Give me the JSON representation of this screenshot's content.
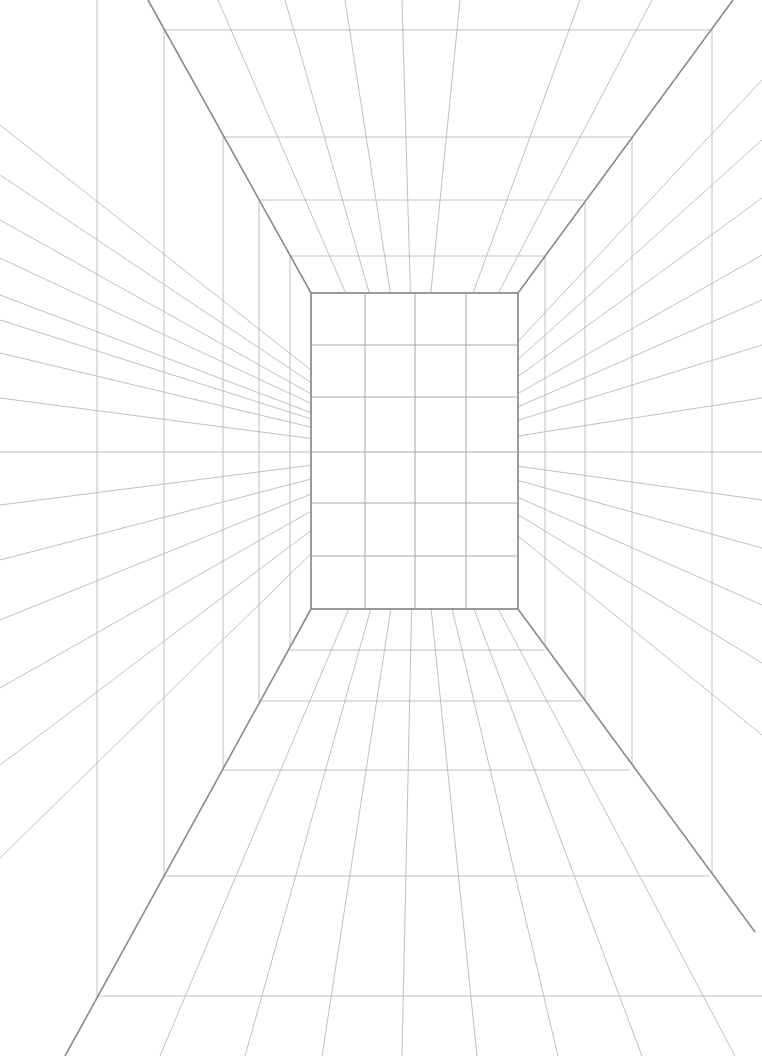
{
  "canvas": {
    "width": 762,
    "height": 1056,
    "background": "#ffffff"
  },
  "colors": {
    "line": "#b9b9b9",
    "edge": "#8a8a8a"
  },
  "vanishing_point": {
    "x": 415,
    "y": 452
  },
  "back_wall": {
    "x1": 311,
    "y1": 293,
    "x2": 518,
    "y2": 609,
    "columns_x": [
      365,
      415,
      466
    ],
    "rows_y": [
      345,
      397,
      452,
      503,
      556
    ]
  },
  "room_edges": [
    {
      "name": "ceiling-left-edge",
      "x1": 148,
      "y1": 0,
      "x2": 311,
      "y2": 293
    },
    {
      "name": "ceiling-right-edge",
      "x1": 733,
      "y1": 0,
      "x2": 518,
      "y2": 293
    },
    {
      "name": "floor-left-edge",
      "x1": 311,
      "y1": 609,
      "x2": 65,
      "y2": 1056
    },
    {
      "name": "floor-right-edge",
      "x1": 518,
      "y1": 609,
      "x2": 755,
      "y2": 932
    }
  ],
  "ceiling": {
    "horizontals": [
      {
        "y": 30,
        "x1": 165,
        "x2": 712
      },
      {
        "y": 137,
        "x1": 224,
        "x2": 632
      },
      {
        "y": 200,
        "x1": 259,
        "x2": 585
      },
      {
        "y": 256,
        "x1": 290,
        "x2": 545
      }
    ],
    "rays_top_x": [
      218,
      285,
      345,
      402,
      460,
      580,
      652
    ],
    "rays_bottom_x": [
      325,
      345,
      365,
      395,
      415,
      440,
      466,
      490
    ]
  },
  "floor": {
    "horizontals": [
      {
        "y": 650,
        "x1": 290,
        "x2": 545
      },
      {
        "y": 701,
        "x1": 261,
        "x2": 583
      },
      {
        "y": 770,
        "x1": 223,
        "x2": 630
      },
      {
        "y": 876,
        "x1": 164,
        "x2": 710
      },
      {
        "y": 996,
        "x1": 97,
        "x2": 762
      }
    ],
    "rays_bottom_x": [
      160,
      245,
      322,
      402,
      477,
      558,
      642,
      735
    ],
    "rays_top_x": [
      335,
      357,
      379,
      402,
      422,
      445,
      470,
      494
    ]
  },
  "left_wall": {
    "verticals_x": [
      97,
      164,
      223,
      259,
      290
    ],
    "rays_edge_y": [
      125,
      175,
      220,
      258,
      295,
      320,
      353,
      398,
      452,
      505,
      560,
      620,
      688,
      765,
      858
    ]
  },
  "right_wall": {
    "verticals_x": [
      545,
      585,
      632,
      712
    ],
    "rays_edge_y": [
      80,
      140,
      198,
      255,
      300,
      345,
      398,
      452,
      500,
      548,
      605,
      663,
      735
    ]
  }
}
